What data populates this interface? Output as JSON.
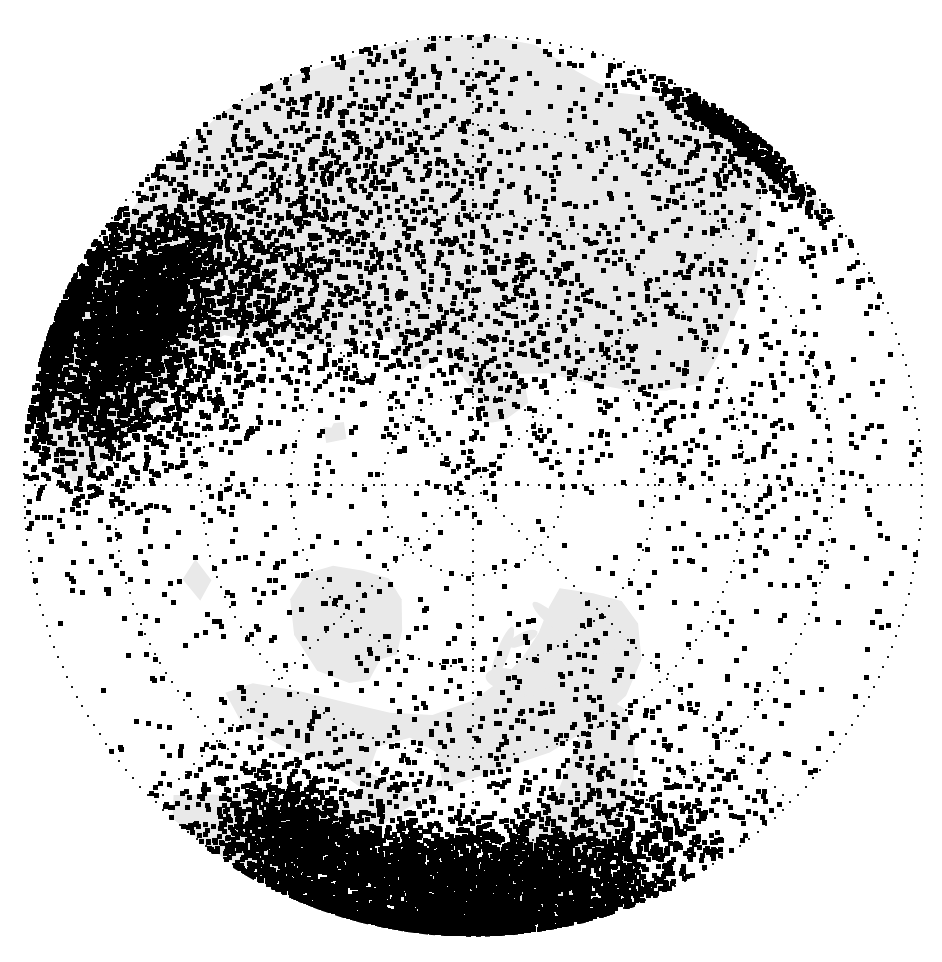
{
  "figure": {
    "title": "",
    "kind": "polar-stereographic-station-map",
    "width": 942,
    "height": 962,
    "background_color": "#ffffff"
  },
  "projection": {
    "name": "north-polar-stereographic",
    "center_x": 473,
    "center_y": 485,
    "outer_radius": 449,
    "pole_label": "North Pole",
    "horizon_latitude_deg": 20
  },
  "style": {
    "land_fill": "#e9e9e9",
    "land_fill_dark": "#e2e2e2",
    "ocean_fill": "#ffffff",
    "graticule_color": "#1a1a1a",
    "point_color": "#000000",
    "point_size_px": 5,
    "graticule_dot_size_px": 2,
    "graticule_dash": "2 9"
  },
  "graticule": {
    "parallels_label": "Latitude circles",
    "parallels_deg": [
      20,
      35,
      50,
      65,
      80
    ],
    "parallels_radius_px": [
      449,
      360,
      272,
      182,
      91
    ],
    "meridians_label": "Meridian lines",
    "meridians_deg": [
      0,
      45,
      90,
      135,
      180,
      225,
      270,
      315
    ],
    "meridian_count": 8
  },
  "chart_data": {
    "type": "scatter",
    "title": "",
    "subtitle": "",
    "xlabel": "",
    "ylabel": "",
    "projection": "north polar stereographic",
    "legend": [],
    "grid": true,
    "marker": "square",
    "marker_color": "#000000",
    "marker_size": 5,
    "total_points_approx": 6400,
    "clusters": [
      {
        "name": "western-north-america",
        "center_r": 0.93,
        "center_theta_deg": 182,
        "count": 1850,
        "spread_r": 0.075,
        "spread_theta_deg": 16,
        "density": "saturated"
      },
      {
        "name": "eastern-north-america",
        "center_r": 0.8,
        "center_theta_deg": 205,
        "count": 280,
        "spread_r": 0.09,
        "spread_theta_deg": 11,
        "density": "high"
      },
      {
        "name": "canada-arctic",
        "center_r": 0.6,
        "center_theta_deg": 168,
        "count": 260,
        "spread_r": 0.17,
        "spread_theta_deg": 26,
        "density": "medium"
      },
      {
        "name": "alaska-bering",
        "center_r": 0.8,
        "center_theta_deg": 155,
        "count": 240,
        "spread_r": 0.12,
        "spread_theta_deg": 15,
        "density": "high"
      },
      {
        "name": "greenland-iceland",
        "center_r": 0.56,
        "center_theta_deg": 240,
        "count": 90,
        "spread_r": 0.14,
        "spread_theta_deg": 22,
        "density": "low"
      },
      {
        "name": "scandinavia-baltic",
        "center_r": 0.72,
        "center_theta_deg": 305,
        "count": 620,
        "spread_r": 0.11,
        "spread_theta_deg": 14,
        "density": "very-high"
      },
      {
        "name": "central-europe",
        "center_r": 0.82,
        "center_theta_deg": 296,
        "count": 900,
        "spread_r": 0.1,
        "spread_theta_deg": 13,
        "density": "saturated"
      },
      {
        "name": "western-europe-britain",
        "center_r": 0.86,
        "center_theta_deg": 281,
        "count": 330,
        "spread_r": 0.1,
        "spread_theta_deg": 10,
        "density": "high"
      },
      {
        "name": "eastern-europe-russia-west",
        "center_r": 0.62,
        "center_theta_deg": 318,
        "count": 480,
        "spread_r": 0.15,
        "spread_theta_deg": 20,
        "density": "high"
      },
      {
        "name": "urals-west-siberia",
        "center_r": 0.46,
        "center_theta_deg": 348,
        "count": 380,
        "spread_r": 0.18,
        "spread_theta_deg": 26,
        "density": "medium"
      },
      {
        "name": "central-siberia",
        "center_r": 0.52,
        "center_theta_deg": 25,
        "count": 420,
        "spread_r": 0.2,
        "spread_theta_deg": 28,
        "density": "medium"
      },
      {
        "name": "east-siberia-far-east",
        "center_r": 0.66,
        "center_theta_deg": 68,
        "count": 300,
        "spread_r": 0.18,
        "spread_theta_deg": 22,
        "density": "medium"
      },
      {
        "name": "kazakhstan-central-asia",
        "center_r": 0.84,
        "center_theta_deg": 337,
        "count": 420,
        "spread_r": 0.11,
        "spread_theta_deg": 15,
        "density": "high"
      },
      {
        "name": "mediterranean-north-africa",
        "center_r": 0.93,
        "center_theta_deg": 291,
        "count": 200,
        "spread_r": 0.06,
        "spread_theta_deg": 9,
        "density": "high"
      },
      {
        "name": "japan-korea-east-asia",
        "center_r": 0.92,
        "center_theta_deg": 37,
        "count": 230,
        "spread_r": 0.07,
        "spread_theta_deg": 11,
        "density": "high"
      },
      {
        "name": "arctic-ocean-sparse",
        "center_r": 0.22,
        "center_theta_deg": 0,
        "count": 70,
        "spread_r": 0.2,
        "spread_theta_deg": 180,
        "density": "very-low"
      }
    ]
  },
  "landmasses": [
    {
      "name": "north-america",
      "label": "North America"
    },
    {
      "name": "greenland",
      "label": "Greenland"
    },
    {
      "name": "eurasia",
      "label": "Eurasia"
    },
    {
      "name": "iceland",
      "label": "Iceland"
    },
    {
      "name": "svalbard",
      "label": "Svalbard"
    },
    {
      "name": "canadian-arctic-archipelago",
      "label": "Canadian Arctic Archipelago"
    },
    {
      "name": "british-isles",
      "label": "British Isles"
    },
    {
      "name": "japan",
      "label": "Japan"
    }
  ]
}
